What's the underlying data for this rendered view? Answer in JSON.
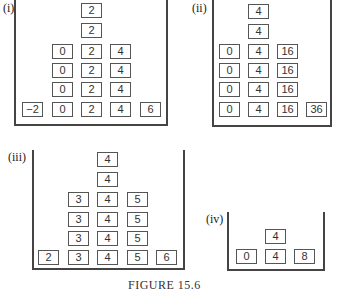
{
  "figure": {
    "caption": "FIGURE 15.6",
    "panels": [
      {
        "label": "(i)",
        "rows": [
          [
            "",
            "",
            "2",
            "",
            ""
          ],
          [
            "",
            "",
            "2",
            "",
            ""
          ],
          [
            "",
            "0",
            "2",
            "4",
            ""
          ],
          [
            "",
            "0",
            "2",
            "4",
            ""
          ],
          [
            "",
            "0",
            "2",
            "4",
            ""
          ],
          [
            "−2",
            "0",
            "2",
            "4",
            "6"
          ]
        ]
      },
      {
        "label": "(ii)",
        "rows": [
          [
            "",
            "4",
            "",
            ""
          ],
          [
            "",
            "4",
            "",
            ""
          ],
          [
            "0",
            "4",
            "16",
            ""
          ],
          [
            "0",
            "4",
            "16",
            ""
          ],
          [
            "0",
            "4",
            "16",
            ""
          ],
          [
            "0",
            "4",
            "16",
            "36"
          ]
        ]
      },
      {
        "label": "(iii)",
        "rows": [
          [
            "",
            "",
            "4",
            "",
            ""
          ],
          [
            "",
            "",
            "4",
            "",
            ""
          ],
          [
            "",
            "3",
            "4",
            "5",
            ""
          ],
          [
            "",
            "3",
            "4",
            "5",
            ""
          ],
          [
            "",
            "3",
            "4",
            "5",
            ""
          ],
          [
            "2",
            "3",
            "4",
            "5",
            "6"
          ]
        ]
      },
      {
        "label": "(iv)",
        "rows": [
          [
            "",
            "4",
            ""
          ],
          [
            "0",
            "4",
            "8"
          ]
        ]
      }
    ]
  }
}
